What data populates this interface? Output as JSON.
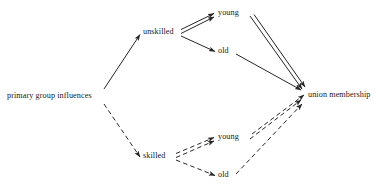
{
  "diagram": {
    "type": "path-diagram",
    "title": "",
    "background_color": "#ffffff",
    "line_color": "#262626",
    "text_color": "#1a1a1a",
    "nodes": [
      {
        "id": "primary",
        "label": "primary group influences",
        "x": 7,
        "y": 92,
        "anchor_x": 103,
        "anchor_y": 96
      },
      {
        "id": "unskilled",
        "label": "unskilled",
        "x": 143,
        "y": 28,
        "anchor_x": 180,
        "anchor_y": 33
      },
      {
        "id": "skilled",
        "label": "skilled",
        "x": 143,
        "y": 152,
        "anchor_x": 175,
        "anchor_y": 157
      },
      {
        "id": "young-unskilled",
        "label": "young",
        "x": 219,
        "y": 9,
        "anchor_x": 250,
        "anchor_y": 15
      },
      {
        "id": "old-unskilled",
        "label": "old",
        "x": 219,
        "y": 47,
        "anchor_x": 235,
        "anchor_y": 53
      },
      {
        "id": "young-skilled",
        "label": "young",
        "x": 219,
        "y": 133,
        "anchor_x": 250,
        "anchor_y": 139
      },
      {
        "id": "old-skilled",
        "label": "old",
        "x": 219,
        "y": 171,
        "anchor_x": 235,
        "anchor_y": 177
      },
      {
        "id": "union",
        "label": "union membership",
        "x": 308,
        "y": 91,
        "anchor_x": 303,
        "anchor_y": 95
      }
    ],
    "edges": [
      {
        "id": "primary-to-unskilled",
        "from": "primary",
        "to": "unskilled",
        "style": "solid",
        "multiplicity": 1,
        "arrow": true
      },
      {
        "id": "primary-to-skilled",
        "from": "primary",
        "to": "skilled",
        "style": "dashed",
        "multiplicity": 1,
        "arrow": true
      },
      {
        "id": "unskilled-to-young",
        "from": "unskilled",
        "to": "young-unskilled",
        "style": "solid",
        "multiplicity": 2,
        "arrow": true
      },
      {
        "id": "unskilled-to-old",
        "from": "unskilled",
        "to": "old-unskilled",
        "style": "solid",
        "multiplicity": 1,
        "arrow": true
      },
      {
        "id": "young-unskilled-to-union",
        "from": "young-unskilled",
        "to": "union",
        "style": "solid",
        "multiplicity": 2,
        "arrow": true
      },
      {
        "id": "old-unskilled-to-union",
        "from": "old-unskilled",
        "to": "union",
        "style": "solid",
        "multiplicity": 1,
        "arrow": true
      },
      {
        "id": "skilled-to-young",
        "from": "skilled",
        "to": "young-skilled",
        "style": "dashed",
        "multiplicity": 2,
        "arrow": true
      },
      {
        "id": "skilled-to-old",
        "from": "skilled",
        "to": "old-skilled",
        "style": "dashed",
        "multiplicity": 1,
        "arrow": true
      },
      {
        "id": "young-skilled-to-union",
        "from": "young-skilled",
        "to": "union",
        "style": "dashed",
        "multiplicity": 2,
        "arrow": true
      },
      {
        "id": "old-skilled-to-union",
        "from": "old-skilled",
        "to": "union",
        "style": "dashed",
        "multiplicity": 1,
        "arrow": true
      }
    ]
  }
}
